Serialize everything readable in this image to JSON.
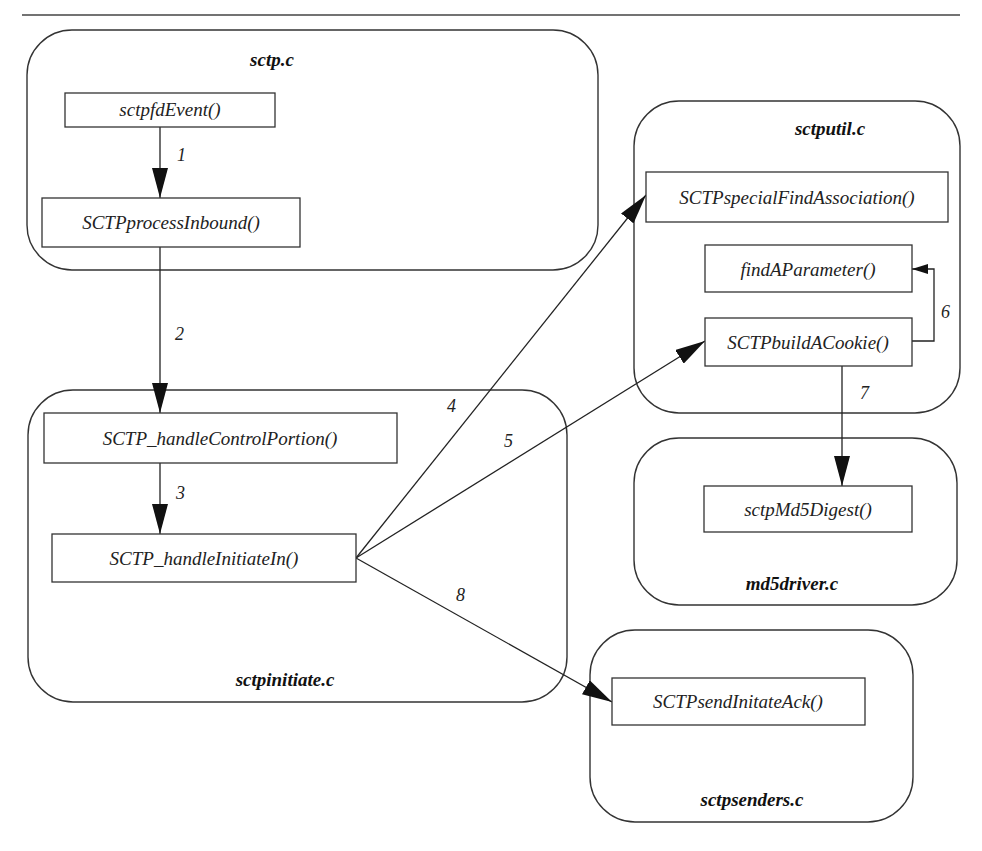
{
  "modules": {
    "sctp": {
      "label": "sctp.c"
    },
    "sctputil": {
      "label": "sctputil.c"
    },
    "sctpinitiate": {
      "label": "sctpinitiate.c"
    },
    "md5driver": {
      "label": "md5driver.c"
    },
    "sctpsenders": {
      "label": "sctpsenders.c"
    }
  },
  "functions": {
    "sctpfdEvent": {
      "label": "sctpfdEvent()",
      "module": "sctp.c"
    },
    "SCTPprocessInbound": {
      "label": "SCTPprocessInbound()",
      "module": "sctp.c"
    },
    "SCTPspecialFindAssociation": {
      "label": "SCTPspecialFindAssociation()",
      "module": "sctputil.c"
    },
    "findAParameter": {
      "label": "findAParameter()",
      "module": "sctputil.c"
    },
    "SCTPbuildACookie": {
      "label": "SCTPbuildACookie()",
      "module": "sctputil.c"
    },
    "SCTP_handleControlPortion": {
      "label": "SCTP_handleControlPortion()",
      "module": "sctpinitiate.c"
    },
    "SCTP_handleInitiateIn": {
      "label": "SCTP_handleInitiateIn()",
      "module": "sctpinitiate.c"
    },
    "sctpMd5Digest": {
      "label": "sctpMd5Digest()",
      "module": "md5driver.c"
    },
    "SCTPsendInitateAck": {
      "label": "SCTPsendInitateAck()",
      "module": "sctpsenders.c"
    }
  },
  "edges": [
    {
      "label": "1",
      "from": "sctpfdEvent()",
      "to": "SCTPprocessInbound()"
    },
    {
      "label": "2",
      "from": "SCTPprocessInbound()",
      "to": "SCTP_handleControlPortion()"
    },
    {
      "label": "3",
      "from": "SCTP_handleControlPortion()",
      "to": "SCTP_handleInitiateIn()"
    },
    {
      "label": "4",
      "from": "SCTP_handleInitiateIn()",
      "to": "SCTPspecialFindAssociation()"
    },
    {
      "label": "5",
      "from": "SCTP_handleInitiateIn()",
      "to": "SCTPbuildACookie()"
    },
    {
      "label": "6",
      "from": "SCTPbuildACookie()",
      "to": "findAParameter()"
    },
    {
      "label": "7",
      "from": "SCTPbuildACookie()",
      "to": "sctpMd5Digest()"
    },
    {
      "label": "8",
      "from": "SCTP_handleInitiateIn()",
      "to": "SCTPsendInitateAck()"
    }
  ]
}
